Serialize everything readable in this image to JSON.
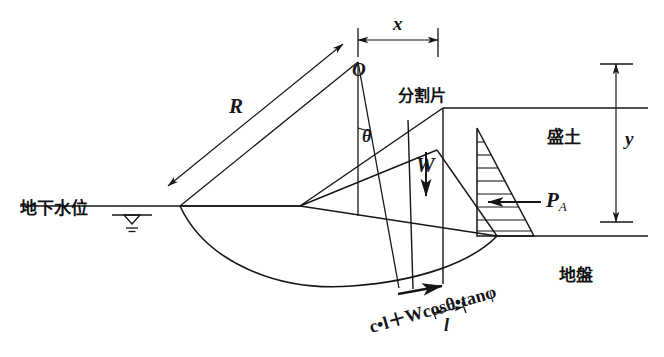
{
  "figure": {
    "type": "engineering-diagram",
    "stroke_color": "#16161a",
    "background_color": "#ffffff"
  },
  "labels": {
    "center_point": "O",
    "radius": "R",
    "horizontal_offset": "x",
    "vertical_offset": "y",
    "angle": "θ",
    "weight": "W",
    "slice": "分割片",
    "embankment": "盛土",
    "ground": "地盤",
    "groundwater_level": "地下水位",
    "active_earth_pressure_main": "P",
    "active_earth_pressure_sub": "A",
    "resisting_force_formula": "c•l＋Wcosθ•tanφ",
    "slice_base_length": "l"
  },
  "annotations": {
    "dimension_x": "x",
    "dimension_y": "y",
    "dimension_l": "l",
    "water_table_symbol": "▽"
  }
}
